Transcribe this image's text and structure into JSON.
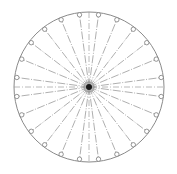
{
  "diagram": {
    "title": "",
    "spoke_count": 24,
    "spoke_offset_deg": 7.5,
    "spoke_step_deg": 15,
    "axes": [
      "horizontal",
      "vertical"
    ],
    "colors": {
      "rim": "#8a8a8a",
      "spoke": "#9a9a9a",
      "axis": "#a8a8a8",
      "marker": "#7a7a7a",
      "hub": "#1a1a1a"
    }
  }
}
